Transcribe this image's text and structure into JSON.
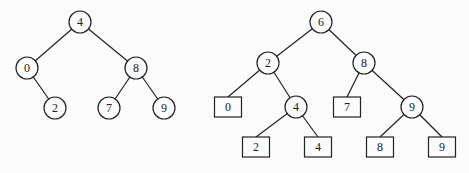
{
  "trees": [
    {
      "name": "binary-search-tree",
      "nodes": [
        {
          "id": "a4",
          "label": "4",
          "shape": "circle",
          "x": 80,
          "y": 22
        },
        {
          "id": "a0",
          "label": "0",
          "shape": "circle",
          "x": 27,
          "y": 68
        },
        {
          "id": "a8",
          "label": "8",
          "shape": "circle",
          "x": 136,
          "y": 68
        },
        {
          "id": "a2",
          "label": "2",
          "shape": "circle",
          "x": 55,
          "y": 108
        },
        {
          "id": "a7",
          "label": "7",
          "shape": "circle",
          "x": 109,
          "y": 108
        },
        {
          "id": "a9",
          "label": "9",
          "shape": "circle",
          "x": 164,
          "y": 108
        }
      ],
      "edges": [
        [
          "a4",
          "a0"
        ],
        [
          "a4",
          "a8"
        ],
        [
          "a0",
          "a2"
        ],
        [
          "a8",
          "a7"
        ],
        [
          "a8",
          "a9"
        ]
      ]
    },
    {
      "name": "leaf-tree",
      "nodes": [
        {
          "id": "b6",
          "label": "6",
          "shape": "circle",
          "x": 321,
          "y": 22
        },
        {
          "id": "b2",
          "label": "2",
          "shape": "circle",
          "x": 268,
          "y": 63
        },
        {
          "id": "b8",
          "label": "8",
          "shape": "circle",
          "x": 364,
          "y": 63
        },
        {
          "id": "b0",
          "label": "0",
          "shape": "box",
          "x": 228,
          "y": 107
        },
        {
          "id": "b4",
          "label": "4",
          "shape": "circle",
          "x": 296,
          "y": 107
        },
        {
          "id": "b7",
          "label": "7",
          "shape": "box",
          "x": 347,
          "y": 107
        },
        {
          "id": "b9",
          "label": "9",
          "shape": "circle",
          "x": 412,
          "y": 107
        },
        {
          "id": "b2l",
          "label": "2",
          "shape": "box",
          "x": 256,
          "y": 147
        },
        {
          "id": "b4l",
          "label": "4",
          "shape": "box",
          "x": 318,
          "y": 147
        },
        {
          "id": "b8l",
          "label": "8",
          "shape": "box",
          "x": 380,
          "y": 147
        },
        {
          "id": "b9l",
          "label": "9",
          "shape": "box",
          "x": 442,
          "y": 147
        }
      ],
      "edges": [
        [
          "b6",
          "b2"
        ],
        [
          "b6",
          "b8"
        ],
        [
          "b2",
          "b0"
        ],
        [
          "b2",
          "b4"
        ],
        [
          "b8",
          "b7"
        ],
        [
          "b8",
          "b9"
        ],
        [
          "b4",
          "b2l"
        ],
        [
          "b4",
          "b4l"
        ],
        [
          "b9",
          "b8l"
        ],
        [
          "b9",
          "b9l"
        ]
      ]
    }
  ]
}
